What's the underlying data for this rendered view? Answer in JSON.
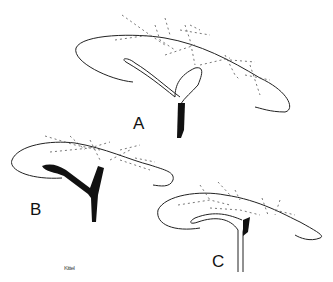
{
  "figure": {
    "panels": [
      {
        "id": "A",
        "label": "A"
      },
      {
        "id": "B",
        "label": "B"
      },
      {
        "id": "C",
        "label": "C"
      }
    ],
    "signature": "Kittel"
  }
}
